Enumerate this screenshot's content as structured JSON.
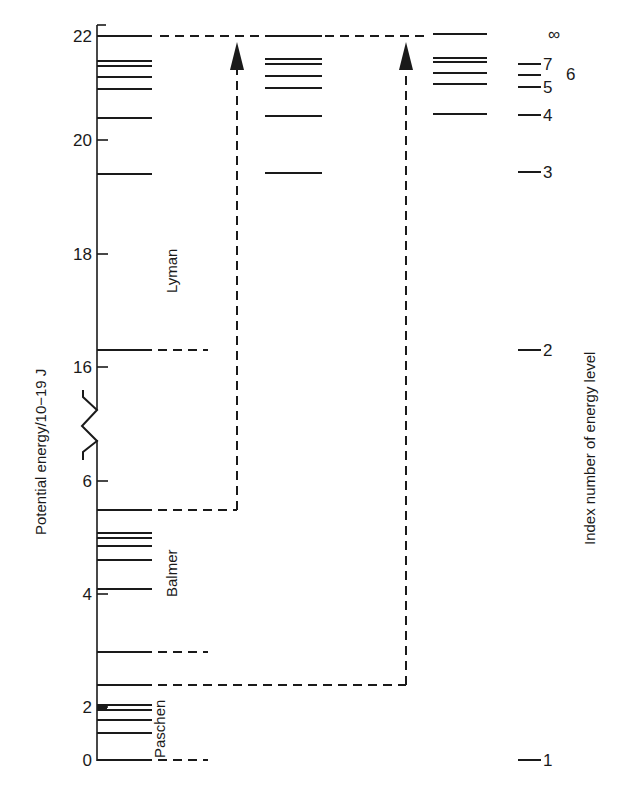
{
  "chart_data": {
    "type": "energy-level-diagram",
    "title": "",
    "ylabel": "Potential energy/10−19 J",
    "y2label": "Index number of energy level",
    "y_ticks": [
      {
        "label": "22",
        "y": 36
      },
      {
        "label": "20",
        "y": 140
      },
      {
        "label": "18",
        "y": 254
      },
      {
        "label": "16",
        "y": 367
      },
      {
        "label": "6",
        "y": 481
      },
      {
        "label": "4",
        "y": 594
      },
      {
        "label": "2",
        "y": 707
      },
      {
        "label": "0",
        "y": 760
      }
    ],
    "axis_break": {
      "between": [
        "16",
        "6"
      ],
      "y": 425
    },
    "series": [
      {
        "name": "Lyman",
        "ground_level_value": 0,
        "levels_y": [
          36,
          61,
          66,
          77,
          89,
          118,
          174,
          350,
          760
        ],
        "label_pos": {
          "x": 172,
          "y": 260
        }
      },
      {
        "name": "Balmer",
        "levels_y": [
          510,
          533,
          538,
          546,
          560,
          589
        ],
        "label_pos": {
          "x": 172,
          "y": 570
        }
      },
      {
        "name": "Paschen",
        "levels_y": [
          652,
          685,
          705,
          710,
          720,
          733
        ],
        "label_pos": {
          "x": 160,
          "y": 728
        }
      }
    ],
    "middle_column_levels_y": [
      36,
      59,
      64,
      76,
      88,
      116,
      173
    ],
    "right_column_levels_y": [
      34,
      58,
      62,
      73,
      84,
      114
    ],
    "energy_levels": [
      {
        "n": "1",
        "energy_1e-19J": 0,
        "label_y": 760
      },
      {
        "n": "2",
        "energy_1e-19J": 16.3,
        "label_y": 350
      },
      {
        "n": "3",
        "energy_1e-19J": 19.4,
        "label_y": 172
      },
      {
        "n": "4",
        "energy_1e-19J": 20.4,
        "label_y": 115
      },
      {
        "n": "5",
        "energy_1e-19J": 20.9,
        "label_y": 87
      },
      {
        "n": "6",
        "energy_1e-19J": 21.2,
        "label_y": 75
      },
      {
        "n": "7",
        "energy_1e-19J": 21.4,
        "label_y": 64
      },
      {
        "n": "∞",
        "energy_1e-19J": 21.8,
        "label_y": 36
      }
    ],
    "ionisation_arrows": [
      {
        "from_series": "Balmer",
        "from_y": 510,
        "to_y": 36,
        "x": 237
      },
      {
        "from_series": "Paschen",
        "from_y": 685,
        "to_y": 36,
        "x": 406
      }
    ],
    "grid": false,
    "legend": "none"
  }
}
